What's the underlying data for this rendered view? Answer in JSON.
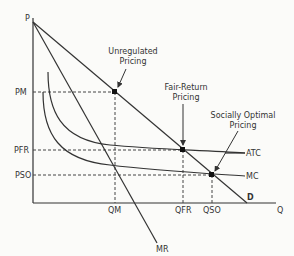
{
  "diagram": {
    "axes": {
      "y_label": "P",
      "x_label": "Q"
    },
    "curves": {
      "demand": "D",
      "marginal_revenue": "MR",
      "average_total_cost": "ATC",
      "marginal_cost": "MC"
    },
    "price_levels": {
      "monopoly": "PM",
      "fair_return": "PFR",
      "socially_optimal": "PSO"
    },
    "quantity_levels": {
      "monopoly": "QM",
      "fair_return": "QFR",
      "socially_optimal": "QSO"
    },
    "annotations": {
      "unregulated": {
        "line1": "Unregulated",
        "line2": "Pricing"
      },
      "fair_return": {
        "line1": "Fair-Return",
        "line2": "Pricing"
      },
      "socially_optimal": {
        "line1": "Socially Optimal",
        "line2": "Pricing"
      }
    }
  }
}
